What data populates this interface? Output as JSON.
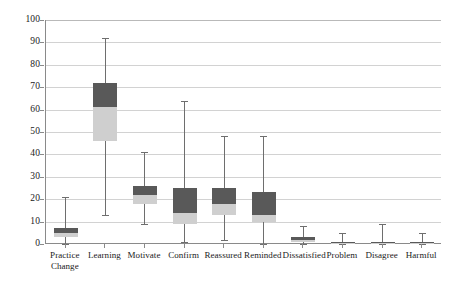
{
  "chart_data": {
    "type": "box",
    "title": "",
    "xlabel": "",
    "ylabel": "",
    "ylim": [
      0,
      100
    ],
    "yticks": [
      0,
      10,
      20,
      30,
      40,
      50,
      60,
      70,
      80,
      90,
      100
    ],
    "ytick_labels": [
      "0",
      "10",
      "20",
      "30",
      "40",
      "50",
      "60",
      "70",
      "80",
      "90",
      "100"
    ],
    "grid": true,
    "legend": "none",
    "categories": [
      "Practice\nChange",
      "Learning",
      "Motivate",
      "Confirm",
      "Reassured",
      "Reminded",
      "Dissatisfied",
      "Problem",
      "Disagree",
      "Harmful"
    ],
    "boxes": [
      {
        "category": "Practice Change",
        "whisker_low": 0,
        "q1": 3,
        "median": 5,
        "q3": 7,
        "whisker_high": 21
      },
      {
        "category": "Learning",
        "whisker_low": 13,
        "q1": 46,
        "median": 61,
        "q3": 72,
        "whisker_high": 92
      },
      {
        "category": "Motivate",
        "whisker_low": 9,
        "q1": 18,
        "median": 22,
        "q3": 26,
        "whisker_high": 41
      },
      {
        "category": "Confirm",
        "whisker_low": 1,
        "q1": 9,
        "median": 14,
        "q3": 25,
        "whisker_high": 64
      },
      {
        "category": "Reassured",
        "whisker_low": 2,
        "q1": 13,
        "median": 18,
        "q3": 25,
        "whisker_high": 48
      },
      {
        "category": "Reminded",
        "whisker_low": 0,
        "q1": 10,
        "median": 13,
        "q3": 23,
        "whisker_high": 48
      },
      {
        "category": "Dissatisfied",
        "whisker_low": 0,
        "q1": 1,
        "median": 2,
        "q3": 3,
        "whisker_high": 8
      },
      {
        "category": "Problem",
        "whisker_low": 0,
        "q1": 0,
        "median": 0.5,
        "q3": 1,
        "whisker_high": 5
      },
      {
        "category": "Disagree",
        "whisker_low": 0,
        "q1": 0,
        "median": 0.5,
        "q3": 1,
        "whisker_high": 9
      },
      {
        "category": "Harmful",
        "whisker_low": 0,
        "q1": 0,
        "median": 0.5,
        "q3": 1,
        "whisker_high": 5
      }
    ],
    "colors": {
      "box_upper": "#595959",
      "box_lower": "#cfcfcf",
      "whisker": "#6e6e6e",
      "gridline": "#d2d2d2",
      "axis": "#8a8a8a",
      "background": "#ffffff"
    }
  }
}
